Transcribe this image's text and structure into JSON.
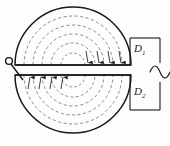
{
  "figure": {
    "background_color": "#fdfdfd",
    "ink_color": "#1a1a1a",
    "dash_color": "#777777",
    "labels": {
      "upper_disc": "D",
      "upper_disc_sub": "1",
      "lower_disc": "D",
      "lower_disc_sub": "2"
    },
    "icons": {
      "ac_source": "ac-source-sine-icon",
      "terminal": "terminal-node-icon",
      "arrow": "current-direction-arrow-icon"
    },
    "geometry": {
      "disc_center_x": 73,
      "disc_center_y": 70,
      "disc_radius_x": 58,
      "disc_radius_y": 58,
      "gap_half_height": 5,
      "dashed_arc_count": 5,
      "dashed_arc_radii": [
        49,
        40,
        31,
        22,
        12
      ]
    },
    "upper_arrows_x": [
      88,
      99,
      110,
      121
    ],
    "lower_arrows_x": [
      30,
      41,
      52,
      63
    ],
    "circuit": {
      "right_rail_x": 160,
      "top_wire_y": 38,
      "bottom_wire_y": 110,
      "source_y": 72
    },
    "terminal": {
      "circle_x": 9,
      "circle_y": 61,
      "circle_r": 3.4,
      "lead_end_x": 22,
      "lead_end_y": 79
    }
  }
}
